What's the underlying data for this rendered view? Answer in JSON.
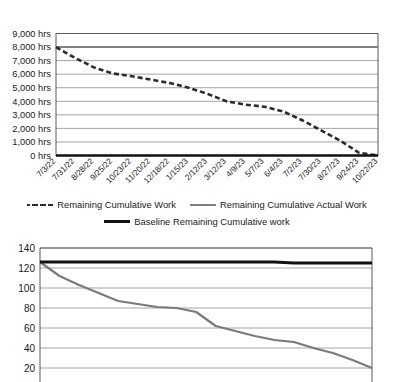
{
  "legend": {
    "items": [
      {
        "label": "Remaining Cumulative Work",
        "style": "dashed",
        "color": "#2b2b2b"
      },
      {
        "label": "Remaining Cumulative Actual Work",
        "style": "solid",
        "color": "#808080"
      },
      {
        "label": "Baseline Remaining Cumulative work",
        "style": "solid-thick",
        "color": "#111111"
      }
    ]
  },
  "chart_data": [
    {
      "type": "line",
      "title": "",
      "xlabel": "",
      "ylabel": "",
      "ylim": [
        0,
        9000
      ],
      "yticks": [
        0,
        1000,
        2000,
        3000,
        4000,
        5000,
        6000,
        7000,
        8000,
        9000
      ],
      "ytick_labels": [
        "0 hrs",
        "1,000 hrs",
        "2,000 hrs",
        "3,000 hrs",
        "4,000 hrs",
        "5,000 hrs",
        "6,000 hrs",
        "7,000 hrs",
        "8,000 hrs",
        "9,000 hrs"
      ],
      "grid": true,
      "legend_position": "below",
      "categories": [
        "7/3/22",
        "7/31/22",
        "8/28/22",
        "9/25/22",
        "10/23/22",
        "11/20/22",
        "12/18/22",
        "1/15/23",
        "2/12/23",
        "3/12/23",
        "4/9/23",
        "5/7/23",
        "6/4/23",
        "7/2/23",
        "7/30/23",
        "8/27/23",
        "9/24/23",
        "10/22/23"
      ],
      "series": [
        {
          "name": "Remaining Cumulative Work",
          "style": "dashed",
          "color": "#2b2b2b",
          "values": [
            8000,
            7200,
            6500,
            6050,
            5850,
            5600,
            5350,
            5000,
            4550,
            4000,
            3750,
            3600,
            3250,
            2600,
            1850,
            1100,
            200,
            0
          ]
        },
        {
          "name": "Baseline Remaining Cumulative work",
          "style": "solid-thick",
          "color": "#808080",
          "values": [
            8000,
            8000,
            8000,
            8000,
            8000,
            8000,
            8000,
            8000,
            8000,
            8000,
            8000,
            8000,
            8000,
            8000,
            8000,
            8000,
            8000,
            8000
          ]
        }
      ]
    },
    {
      "type": "line",
      "title": "",
      "xlabel": "",
      "ylabel": "",
      "ylim": [
        0,
        140
      ],
      "yticks": [
        20,
        40,
        60,
        80,
        100,
        120,
        140
      ],
      "ytick_labels": [
        "20",
        "40",
        "60",
        "80",
        "100",
        "120",
        "140"
      ],
      "grid": true,
      "legend_position": "none",
      "note": "chart is cropped at the bottom edge of the screenshot",
      "categories": [
        "7/3/22",
        "7/31/22",
        "8/28/22",
        "9/25/22",
        "10/23/22",
        "11/20/22",
        "12/18/22",
        "1/15/23",
        "2/12/23",
        "3/12/23",
        "4/9/23",
        "5/7/23",
        "6/4/23",
        "7/2/23",
        "7/30/23",
        "8/27/23",
        "9/24/23",
        "10/22/23"
      ],
      "series": [
        {
          "name": "Remaining Cumulative Actual Work",
          "style": "solid",
          "color": "#7a7a7a",
          "values": [
            126,
            112,
            103,
            95,
            87,
            84,
            81,
            80,
            76,
            62,
            57,
            52,
            48,
            46,
            40,
            35,
            28,
            20
          ]
        },
        {
          "name": "Baseline Remaining Cumulative work",
          "style": "solid-thick",
          "color": "#111111",
          "values": [
            126,
            126,
            126,
            126,
            126,
            126,
            126,
            126,
            126,
            126,
            126,
            126,
            126,
            125,
            125,
            125,
            125,
            125
          ]
        }
      ]
    }
  ]
}
